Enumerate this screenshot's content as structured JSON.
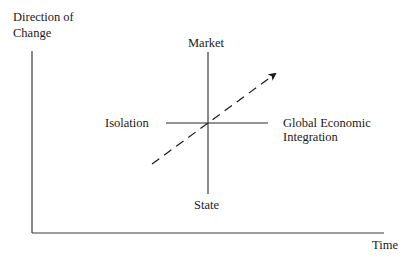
{
  "axes": {
    "y_label_line1": "Direction of",
    "y_label_line2": "Change",
    "x_label": "Time"
  },
  "quadrant": {
    "top": "Market",
    "bottom": "State",
    "left": "Isolation",
    "right_line1": "Global Economic",
    "right_line2": "Integration"
  },
  "trend": {
    "style": "dashed",
    "direction": "from lower-left (State/Isolation) to upper-right (Market/Global Economic Integration)"
  },
  "colors": {
    "ink": "#1a1a1a",
    "background": "#ffffff"
  }
}
